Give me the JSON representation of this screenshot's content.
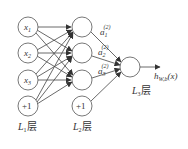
{
  "diagram": {
    "layers": [
      {
        "label": "L",
        "sub": "1",
        "suffix": "层",
        "nodes": [
          {
            "text": "x",
            "sub": "1"
          },
          {
            "text": "x",
            "sub": "2"
          },
          {
            "text": "x",
            "sub": "3"
          },
          {
            "text": "+1",
            "sub": ""
          }
        ]
      },
      {
        "label": "L",
        "sub": "2",
        "suffix": "层",
        "nodes": [
          {
            "text": "",
            "sub": ""
          },
          {
            "text": "",
            "sub": ""
          },
          {
            "text": "",
            "sub": ""
          },
          {
            "text": "+1",
            "sub": ""
          }
        ]
      },
      {
        "label": "L",
        "sub": "3",
        "suffix": "层",
        "nodes": [
          {
            "text": "",
            "sub": ""
          }
        ]
      }
    ],
    "activations": [
      {
        "text": "a",
        "sub": "1",
        "sup": "(2)"
      },
      {
        "text": "a",
        "sub": "2",
        "sup": "(2)"
      },
      {
        "text": "a",
        "sub": "3",
        "sup": "(2)"
      }
    ],
    "output": {
      "text": "h",
      "sub": "W,b",
      "arg": "(x)"
    },
    "colors": {
      "stroke": "#555555",
      "text": "#333333",
      "background": "#ffffff"
    }
  }
}
